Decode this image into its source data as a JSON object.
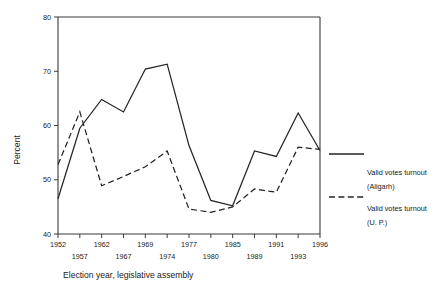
{
  "chart_data": {
    "type": "line",
    "title": "",
    "xlabel": "Election year, legislative assembly",
    "ylabel": "Percent",
    "ylim": [
      40,
      80
    ],
    "yticks": [
      40,
      50,
      60,
      70,
      80
    ],
    "ytick_labels": [
      "40",
      "50",
      "60",
      "70",
      "80"
    ],
    "grid": false,
    "legend_position": "right",
    "categories": [
      "1952",
      "1957",
      "1962",
      "1967",
      "1969",
      "1974",
      "1977",
      "1980",
      "1985",
      "1989",
      "1991",
      "1993",
      "1996"
    ],
    "xtick_labels_top": [
      "1952",
      "",
      "1962",
      "",
      "1969",
      "",
      "1977",
      "",
      "1985",
      "",
      "1991",
      "",
      "1996"
    ],
    "xtick_labels_bottom": [
      "",
      "1957",
      "",
      "1967",
      "",
      "1974",
      "",
      "1980",
      "",
      "1989",
      "",
      "1993",
      ""
    ],
    "series": [
      {
        "name": "Valid votes turnout (Aligarh)",
        "style": "solid",
        "values": [
          46.5,
          59.5,
          64.8,
          62.5,
          70.4,
          71.3,
          56.3,
          46.2,
          45.2,
          55.3,
          54.3,
          62.3,
          55.4
        ]
      },
      {
        "name": "Valid votes turnout (U. P.)",
        "style": "dashed",
        "values": [
          52.8,
          62.5,
          48.9,
          50.6,
          52.4,
          55.3,
          44.6,
          44.0,
          45.0,
          48.3,
          47.7,
          56.0,
          55.6
        ]
      }
    ]
  },
  "legend": {
    "entries": [
      {
        "line1": "Valid votes turnout",
        "line2": "(Aligarh)",
        "style": "solid"
      },
      {
        "line1": "Valid votes turnout",
        "line2": "(U. P.)",
        "style": "dashed"
      }
    ]
  },
  "colors": {
    "line": "#242424",
    "axis": "#3a3a3a",
    "background": "#ffffff"
  }
}
